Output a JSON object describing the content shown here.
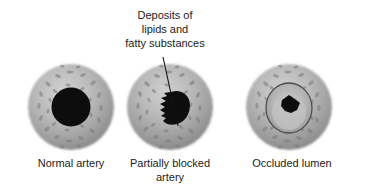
{
  "figure": {
    "background_color": "#ffffff",
    "title_annotation": {
      "lines": [
        "Deposits of",
        "lipids and",
        "fatty substances"
      ],
      "full_text": "Deposits of lipids and fatty substances",
      "text_color": "#1b1b1b",
      "leader_line": {
        "from_x": 163,
        "from_y": 57,
        "to_x": 178,
        "to_y": 126,
        "color": "#121212"
      }
    },
    "palette": {
      "wall_light": "#c9c9c9",
      "wall_mid": "#a8a8a8",
      "wall_dark": "#8a8a8a",
      "wall_edge": "#787878",
      "speckle": "#7d7d7d",
      "lumen_dark": "#0d0d0d",
      "plaque_pale": "#b4b4b4",
      "plaque_highlight": "#cfcfcf",
      "inner_ring": "#4a4a4a"
    },
    "specimens": [
      {
        "id": "normal-artery",
        "caption": "Normal artery",
        "caption_lines": [
          "Normal artery"
        ],
        "center_x": 71,
        "center_y": 107,
        "outer_radius": 43,
        "lumen_radius": 19,
        "lumen_state": "open",
        "lumen_fill": "#0d0d0d",
        "has_plaque": false
      },
      {
        "id": "partially-blocked-artery",
        "caption": "Partially blocked artery",
        "caption_lines": [
          "Partially blocked",
          "artery"
        ],
        "center_x": 170,
        "center_y": 107,
        "outer_radius": 43,
        "lumen_radius": 15,
        "lumen_state": "partially-blocked",
        "lumen_fill": "#0d0d0d",
        "has_plaque": true,
        "plaque_side": "left"
      },
      {
        "id": "occluded-lumen-artery",
        "caption": "Occluded lumen",
        "caption_lines": [
          "Occluded lumen"
        ],
        "center_x": 289,
        "center_y": 107,
        "outer_radius": 43,
        "lumen_radius": 7,
        "lumen_state": "occluded",
        "lumen_fill": "#111111",
        "has_plaque": true,
        "plaque_fill": "#b4b4b4",
        "inner_ring_radius": 23
      }
    ]
  }
}
